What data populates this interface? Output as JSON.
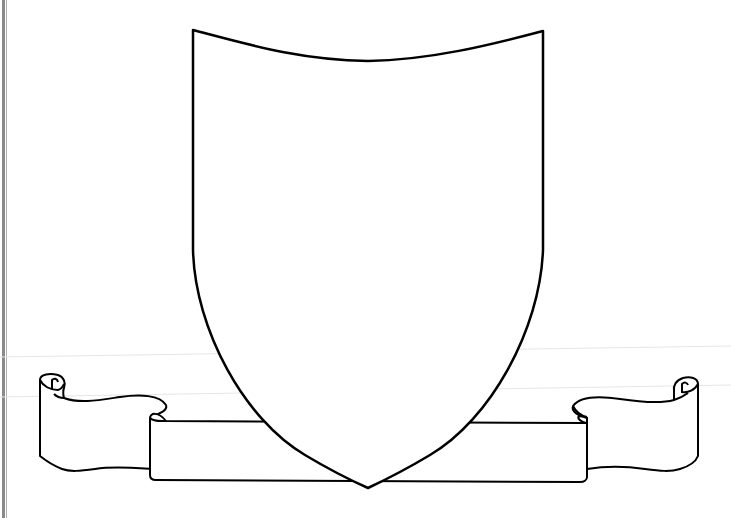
{
  "image": {
    "description": "Blank heraldic shield outline with ribbon scroll banner",
    "colors": {
      "stroke": "#000000",
      "fill": "#ffffff",
      "background": "#ffffff",
      "guide_line": "#e2e2e2",
      "border": "#8a8a8a"
    }
  }
}
